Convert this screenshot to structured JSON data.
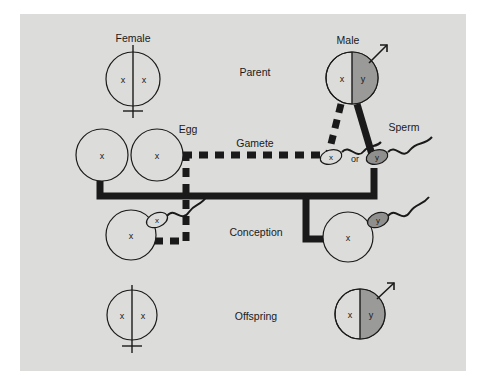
{
  "figure": {
    "background_color": "#dcdcda",
    "page_color": "#ffffff",
    "ink_color": "#1a1a1a",
    "gray_fill_color": "#9a9a98"
  },
  "row_labels": {
    "parent": "Parent",
    "gamete": "Gamete",
    "conception": "Conception",
    "offspring": "Offspring"
  },
  "labels": {
    "female": "Female",
    "male": "Male",
    "egg": "Egg",
    "sperm": "Sperm",
    "or": "or"
  },
  "chromosome_symbols": {
    "x": "x",
    "y": "y"
  },
  "parents": [
    {
      "name": "female-parent",
      "label": "Female",
      "sex_symbol": "venus",
      "left_allele": "x",
      "right_allele": "x",
      "right_half_shaded": false
    },
    {
      "name": "male-parent",
      "label": "Male",
      "sex_symbol": "mars",
      "left_allele": "x",
      "right_allele": "y",
      "right_half_shaded": true
    }
  ],
  "gametes": {
    "eggs": [
      {
        "name": "egg-left",
        "allele": "x",
        "shaded": false
      },
      {
        "name": "egg-right",
        "allele": "x",
        "shaded": false
      }
    ],
    "egg_label": "Egg",
    "sperms": [
      {
        "name": "sperm-x",
        "allele": "x",
        "shaded": false
      },
      {
        "name": "sperm-y",
        "allele": "y",
        "shaded": true
      }
    ],
    "sperm_label": "Sperm",
    "connector": "or"
  },
  "conception": [
    {
      "name": "conception-female",
      "egg_allele": "x",
      "sperm_allele": "x",
      "sperm_shaded": false
    },
    {
      "name": "conception-male",
      "egg_allele": "x",
      "sperm_allele": "y",
      "sperm_shaded": true
    }
  ],
  "offspring": [
    {
      "name": "offspring-female",
      "sex_symbol": "venus",
      "left_allele": "x",
      "right_allele": "x",
      "right_half_shaded": false
    },
    {
      "name": "offspring-male",
      "sex_symbol": "mars",
      "left_allele": "x",
      "right_allele": "y",
      "right_half_shaded": true
    }
  ],
  "paths": {
    "dashed_description": "X-bearing sperm pathway (dashed) leads to female offspring",
    "solid_description": "Y-bearing sperm pathway (solid) leads to male offspring"
  }
}
